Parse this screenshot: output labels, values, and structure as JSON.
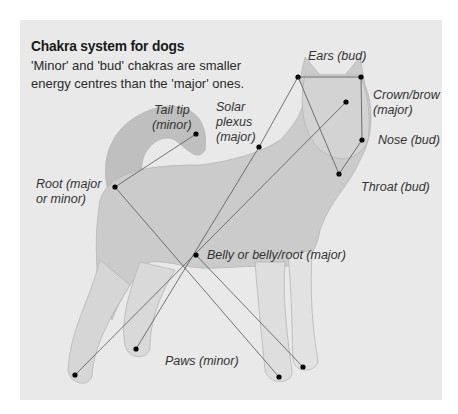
{
  "title": "Chakra system for dogs",
  "subtitle": "'Minor' and 'bud' chakras are smaller energy centres than the 'major' ones.",
  "colors": {
    "page_background": "#ffffff",
    "panel_background": "#e9e9e9",
    "dog_fill": "#c9c9c9",
    "line": "#555555",
    "dot": "#000000"
  },
  "labels": {
    "ears": "Ears (bud)",
    "crown_line1": "Crown/brow",
    "crown_line2": "(major)",
    "nose": "Nose (bud)",
    "throat": "Throat (bud)",
    "tail_line1": "Tail tip",
    "tail_line2": "(minor)",
    "solar_line1": "Solar",
    "solar_line2": "plexus",
    "solar_line3": "(major)",
    "root_line1": "Root (major",
    "root_line2": "or minor)",
    "belly": "Belly or belly/root (major)",
    "paws": "Paws (minor)"
  },
  "chakra_points": [
    {
      "name": "Ears (bud)",
      "points": [
        [
          298,
          77
        ],
        [
          361,
          77
        ]
      ]
    },
    {
      "name": "Crown/brow (major)",
      "points": [
        [
          346,
          102
        ]
      ]
    },
    {
      "name": "Nose (bud)",
      "points": [
        [
          362,
          140
        ]
      ]
    },
    {
      "name": "Throat (bud)",
      "points": [
        [
          339,
          174
        ]
      ]
    },
    {
      "name": "Tail tip (minor)",
      "points": [
        [
          196,
          134
        ]
      ]
    },
    {
      "name": "Solar plexus (major)",
      "points": [
        [
          259,
          147
        ]
      ]
    },
    {
      "name": "Root (major or minor)",
      "points": [
        [
          115,
          187
        ]
      ]
    },
    {
      "name": "Belly or belly/root (major)",
      "points": [
        [
          196,
          255
        ]
      ]
    },
    {
      "name": "Paws (minor)",
      "points": [
        [
          75,
          375
        ],
        [
          136,
          349
        ],
        [
          279,
          377
        ],
        [
          303,
          367
        ]
      ]
    }
  ]
}
